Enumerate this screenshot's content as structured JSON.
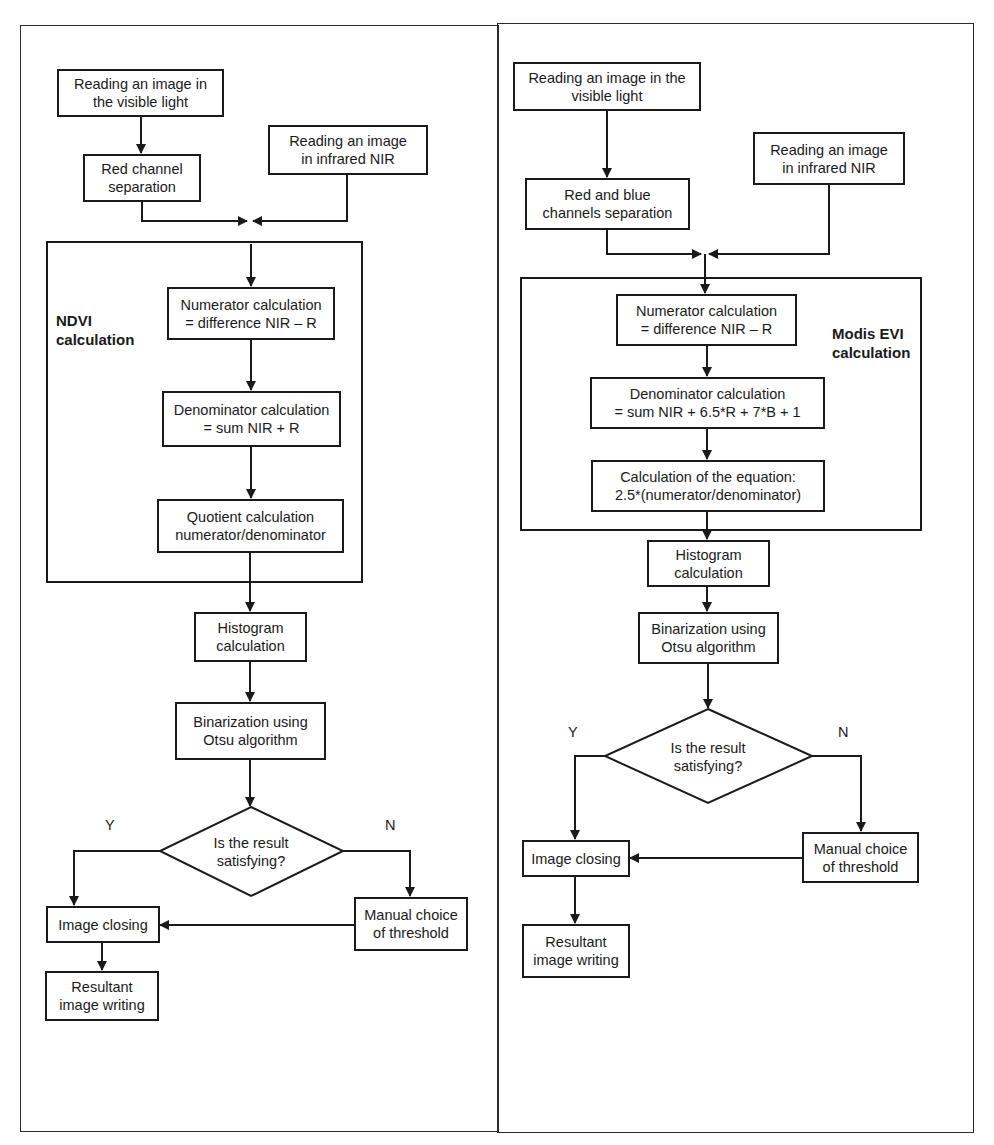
{
  "panels": [
    {
      "name": "NDVI",
      "group_label": "NDVI\ncalculation",
      "nodes": {
        "read_visible": "Reading an image in\nthe visible light",
        "channel_sep": "Red channel\nseparation",
        "read_nir": "Reading an image\nin infrared NIR",
        "numerator": "Numerator calculation\n= difference NIR – R",
        "denominator": "Denominator calculation\n= sum NIR + R",
        "final_calc": "Quotient calculation\nnumerator/denominator",
        "histogram": "Histogram\ncalculation",
        "binarization": "Binarization using\nOtsu algorithm",
        "decision": "Is the result\nsatisfying?",
        "image_closing": "Image closing",
        "manual_threshold": "Manual choice\nof threshold",
        "resultant": "Resultant\nimage writing"
      },
      "yes_label": "Y",
      "no_label": "N"
    },
    {
      "name": "Modis EVI",
      "group_label": "Modis EVI\ncalculation",
      "nodes": {
        "read_visible": "Reading an image in the\nvisible light",
        "channel_sep": "Red and blue\nchannels separation",
        "read_nir": "Reading an image\nin infrared NIR",
        "numerator": "Numerator calculation\n= difference NIR – R",
        "denominator": "Denominator calculation\n= sum NIR + 6.5*R + 7*B + 1",
        "final_calc": "Calculation of the equation:\n2.5*(numerator/denominator)",
        "histogram": "Histogram\ncalculation",
        "binarization": "Binarization using\nOtsu algorithm",
        "decision": "Is the result\nsatisfying?",
        "image_closing": "Image closing",
        "manual_threshold": "Manual choice\nof threshold",
        "resultant": "Resultant\nimage writing"
      },
      "yes_label": "Y",
      "no_label": "N"
    }
  ],
  "colors": {
    "line": "#1a1a1a",
    "background": "#ffffff"
  }
}
